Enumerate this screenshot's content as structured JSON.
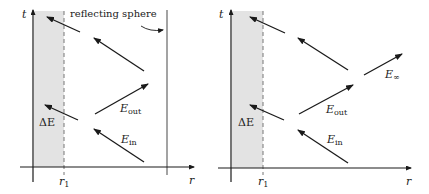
{
  "colors": {
    "ink": "#1a1a1a",
    "shade": "#e3e3e3",
    "sphere_line": "#666666"
  },
  "panels": [
    {
      "name": "left-panel",
      "axis_t": "t",
      "axis_r": "r",
      "r1_label": "r",
      "r1_sub": "1",
      "delta_e": "ΔE",
      "reflecting_label": "reflecting sphere",
      "e_out": "E",
      "e_out_sub": "out",
      "e_in": "E",
      "e_in_sub": "in"
    },
    {
      "name": "right-panel",
      "axis_t": "t",
      "axis_r": "r",
      "r1_label": "r",
      "r1_sub": "1",
      "delta_e": "ΔE",
      "e_out": "E",
      "e_out_sub": "out",
      "e_in": "E",
      "e_in_sub": "in",
      "e_inf": "E",
      "e_inf_sub": "∞"
    }
  ]
}
